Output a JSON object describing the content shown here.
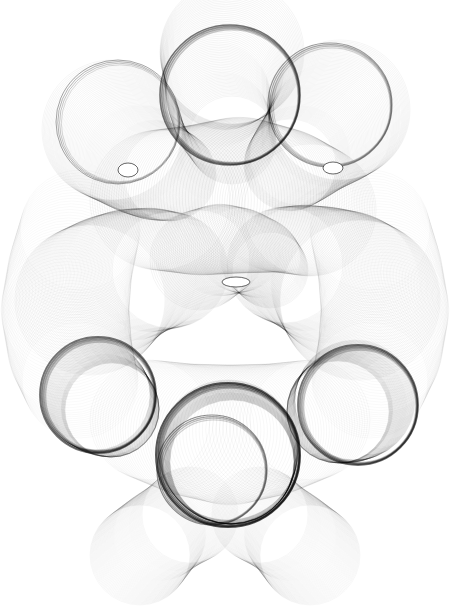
{
  "artwork": {
    "title": "Generative spirograph line drawing",
    "width": 454,
    "height": 607,
    "background": "#ffffff",
    "stroke_color": "#000000",
    "tube_groups": [
      {
        "name": "top-center-bubble",
        "path": [
          [
            232,
            52
          ],
          [
            224,
            70
          ],
          [
            218,
            95
          ],
          [
            222,
            120
          ],
          [
            232,
            140
          ]
        ],
        "radius": [
          72,
          60,
          52,
          48,
          44
        ],
        "count": 70,
        "opacity": 0.1
      },
      {
        "name": "top-right-bubble",
        "path": [
          [
            340,
            110
          ],
          [
            330,
            125
          ],
          [
            315,
            140
          ],
          [
            300,
            155
          ],
          [
            290,
            165
          ]
        ],
        "radius": [
          70,
          62,
          55,
          50,
          46
        ],
        "count": 70,
        "opacity": 0.09
      },
      {
        "name": "top-left-bubble",
        "path": [
          [
            112,
            130
          ],
          [
            125,
            145
          ],
          [
            140,
            160
          ],
          [
            155,
            170
          ],
          [
            170,
            175
          ]
        ],
        "radius": [
          70,
          62,
          55,
          50,
          46
        ],
        "count": 70,
        "opacity": 0.09
      },
      {
        "name": "upper-mid-body",
        "path": [
          [
            160,
            200
          ],
          [
            200,
            200
          ],
          [
            240,
            195
          ],
          [
            280,
            200
          ],
          [
            310,
            210
          ]
        ],
        "radius": [
          70,
          75,
          78,
          72,
          66
        ],
        "count": 60,
        "opacity": 0.1
      },
      {
        "name": "left-mid-lobe",
        "path": [
          [
            90,
            300
          ],
          [
            110,
            285
          ],
          [
            130,
            275
          ],
          [
            150,
            270
          ],
          [
            170,
            270
          ]
        ],
        "radius": [
          75,
          70,
          66,
          62,
          58
        ],
        "count": 70,
        "opacity": 0.09
      },
      {
        "name": "right-mid-lobe",
        "path": [
          [
            360,
            300
          ],
          [
            345,
            285
          ],
          [
            325,
            275
          ],
          [
            305,
            268
          ],
          [
            285,
            265
          ]
        ],
        "radius": [
          80,
          74,
          68,
          63,
          58
        ],
        "count": 70,
        "opacity": 0.09
      },
      {
        "name": "center-swirl",
        "path": [
          [
            200,
            260
          ],
          [
            220,
            250
          ],
          [
            240,
            250
          ],
          [
            260,
            258
          ],
          [
            270,
            270
          ]
        ],
        "radius": [
          50,
          46,
          42,
          40,
          38
        ],
        "count": 50,
        "opacity": 0.1
      },
      {
        "name": "left-lower-ring",
        "path": [
          [
            95,
            395
          ],
          [
            100,
            400
          ],
          [
            105,
            405
          ],
          [
            110,
            408
          ],
          [
            112,
            410
          ]
        ],
        "radius": [
          55,
          53,
          51,
          49,
          47
        ],
        "count": 50,
        "opacity": 0.13
      },
      {
        "name": "right-lower-ring",
        "path": [
          [
            355,
            400
          ],
          [
            350,
            405
          ],
          [
            345,
            408
          ],
          [
            340,
            410
          ],
          [
            338,
            412
          ]
        ],
        "radius": [
          60,
          57,
          55,
          53,
          51
        ],
        "count": 50,
        "opacity": 0.13
      },
      {
        "name": "bottom-center-ring",
        "path": [
          [
            228,
            450
          ],
          [
            229,
            455
          ],
          [
            230,
            458
          ],
          [
            231,
            460
          ],
          [
            232,
            462
          ]
        ],
        "radius": [
          70,
          68,
          66,
          64,
          62
        ],
        "count": 50,
        "opacity": 0.15
      },
      {
        "name": "bottom-left-foot",
        "path": [
          [
            140,
            555
          ],
          [
            150,
            545
          ],
          [
            160,
            535
          ],
          [
            175,
            525
          ],
          [
            190,
            515
          ]
        ],
        "radius": [
          50,
          48,
          46,
          46,
          48
        ],
        "count": 60,
        "opacity": 0.07
      },
      {
        "name": "bottom-right-foot",
        "path": [
          [
            310,
            555
          ],
          [
            300,
            545
          ],
          [
            290,
            535
          ],
          [
            275,
            525
          ],
          [
            260,
            515
          ]
        ],
        "radius": [
          50,
          48,
          46,
          46,
          48
        ],
        "count": 60,
        "opacity": 0.07
      },
      {
        "name": "left-outer-flank",
        "path": [
          [
            80,
            230
          ],
          [
            70,
            270
          ],
          [
            65,
            310
          ],
          [
            70,
            350
          ],
          [
            80,
            380
          ]
        ],
        "radius": [
          60,
          62,
          64,
          62,
          58
        ],
        "count": 55,
        "opacity": 0.06
      },
      {
        "name": "right-outer-flank",
        "path": [
          [
            370,
            230
          ],
          [
            380,
            270
          ],
          [
            385,
            310
          ],
          [
            380,
            350
          ],
          [
            370,
            380
          ]
        ],
        "radius": [
          60,
          62,
          64,
          62,
          58
        ],
        "count": 55,
        "opacity": 0.06
      },
      {
        "name": "lower-body-fill",
        "path": [
          [
            150,
            420
          ],
          [
            190,
            430
          ],
          [
            230,
            435
          ],
          [
            270,
            430
          ],
          [
            310,
            420
          ]
        ],
        "radius": [
          60,
          66,
          70,
          66,
          60
        ],
        "count": 55,
        "opacity": 0.08
      }
    ],
    "dark_rings": [
      {
        "name": "top-center-ring",
        "cx": 230,
        "cy": 95,
        "r": 70,
        "width": 1.6,
        "opacity": 0.55
      },
      {
        "name": "top-right-ring",
        "cx": 330,
        "cy": 105,
        "r": 62,
        "width": 1.2,
        "opacity": 0.4
      },
      {
        "name": "top-left-ring",
        "cx": 118,
        "cy": 122,
        "r": 62,
        "width": 1.0,
        "opacity": 0.35
      },
      {
        "name": "left-lower-ring",
        "cx": 98,
        "cy": 395,
        "r": 58,
        "width": 1.8,
        "opacity": 0.55
      },
      {
        "name": "right-lower-ring",
        "cx": 358,
        "cy": 405,
        "r": 60,
        "width": 1.8,
        "opacity": 0.55
      },
      {
        "name": "bottom-center-ring",
        "cx": 228,
        "cy": 455,
        "r": 72,
        "width": 2.0,
        "opacity": 0.65
      },
      {
        "name": "bottom-inner-ring",
        "cx": 212,
        "cy": 470,
        "r": 55,
        "width": 1.2,
        "opacity": 0.45
      }
    ],
    "holes": [
      {
        "name": "left-eye-hole",
        "cx": 128,
        "cy": 170,
        "rx": 10,
        "ry": 7
      },
      {
        "name": "right-eye-hole",
        "cx": 333,
        "cy": 168,
        "rx": 10,
        "ry": 6
      },
      {
        "name": "center-gap",
        "cx": 236,
        "cy": 282,
        "rx": 14,
        "ry": 5
      }
    ]
  }
}
